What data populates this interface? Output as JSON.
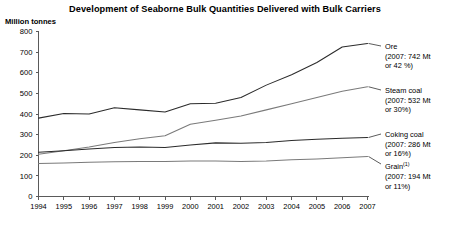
{
  "chart_data": {
    "type": "line",
    "title": "Development of Seaborne Bulk Quantities Delivered with Bulk Carriers",
    "ylabel": "Million tonnes",
    "xlabel": "",
    "ylim": [
      0,
      800
    ],
    "ytick_step": 100,
    "yticks": [
      "0",
      "100",
      "200",
      "300",
      "400",
      "500",
      "600",
      "700",
      "800"
    ],
    "grid": false,
    "legend_position": "right",
    "categories": [
      "1994",
      "1995",
      "1996",
      "1997",
      "1998",
      "1999",
      "2000",
      "2001",
      "2002",
      "2003",
      "2004",
      "2005",
      "2006",
      "2007"
    ],
    "series": [
      {
        "name": "Ore",
        "values": [
          380,
          402,
          400,
          430,
          420,
          410,
          450,
          452,
          480,
          540,
          590,
          650,
          725,
          742
        ]
      },
      {
        "name": "Steam coal",
        "values": [
          205,
          222,
          240,
          262,
          280,
          295,
          350,
          370,
          390,
          420,
          450,
          480,
          510,
          532
        ]
      },
      {
        "name": "Coking coal",
        "values": [
          215,
          222,
          230,
          238,
          240,
          238,
          250,
          260,
          258,
          262,
          272,
          278,
          282,
          286
        ]
      },
      {
        "name": "Grain",
        "values": [
          160,
          162,
          166,
          168,
          170,
          170,
          172,
          172,
          170,
          172,
          178,
          182,
          188,
          194
        ]
      }
    ],
    "annotations": [
      {
        "name": "Ore",
        "superscript": "",
        "detail_line1": "(2007: 742 Mt",
        "detail_line2": "or 42 %)"
      },
      {
        "name": "Steam coal",
        "superscript": "",
        "detail_line1": "(2007: 532 Mt",
        "detail_line2": "or 30%)"
      },
      {
        "name": "Coking coal",
        "superscript": "",
        "detail_line1": "(2007: 286 Mt",
        "detail_line2": "or 16%)"
      },
      {
        "name": "Grain",
        "superscript": "(1)",
        "detail_line1": "(2007: 194 Mt",
        "detail_line2": "or 11%)"
      }
    ],
    "colors": {
      "line_dark": "#2b2b2b",
      "line_light": "#7a7a7a",
      "axis": "#5a5a5a",
      "text": "#000000",
      "background": "#ffffff"
    }
  }
}
